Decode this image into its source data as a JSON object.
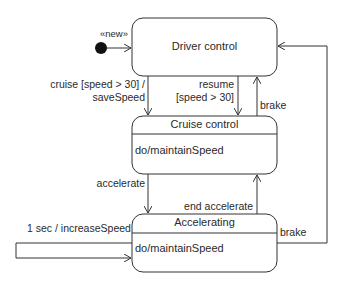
{
  "diagram": {
    "type": "UML state machine",
    "initial": {
      "label": "«new»",
      "target": "Driver control"
    },
    "states": [
      {
        "id": "driver",
        "name": "Driver control",
        "activity": ""
      },
      {
        "id": "cruise",
        "name": "Cruise control",
        "activity": "do/maintainSpeed"
      },
      {
        "id": "accel",
        "name": "Accelerating",
        "activity": "do/maintainSpeed"
      }
    ],
    "transitions": [
      {
        "from": "Driver control",
        "to": "Cruise control",
        "label_line1": "cruise [speed > 30] /",
        "label_line2": "saveSpeed"
      },
      {
        "from": "Driver control",
        "to": "Cruise control",
        "label_line1": "resume",
        "label_line2": "[speed > 30]"
      },
      {
        "from": "Cruise control",
        "to": "Driver control",
        "label": "brake"
      },
      {
        "from": "Cruise control",
        "to": "Accelerating",
        "label": "accelerate"
      },
      {
        "from": "Accelerating",
        "to": "Cruise control",
        "label": "end accelerate"
      },
      {
        "from": "Accelerating",
        "to": "Accelerating",
        "label": "1 sec / increaseSpeed"
      },
      {
        "from": "Accelerating",
        "to": "Driver control",
        "label": "brake"
      }
    ]
  },
  "colors": {
    "line": "#333333",
    "fill": "#ffffff",
    "dot": "#111111"
  }
}
